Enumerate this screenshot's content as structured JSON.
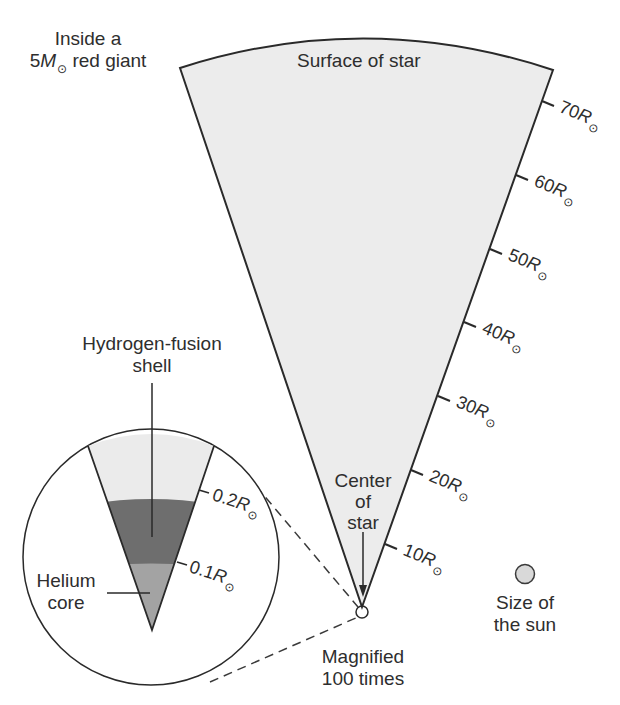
{
  "title": {
    "line1": "Inside a",
    "line2_prefix": "5",
    "line2_symbol": "M",
    "line2_sun": "⊙",
    "line2_suffix": " red giant"
  },
  "main_wedge": {
    "surface_label": "Surface of star",
    "center_label": [
      "Center",
      "of",
      "star"
    ],
    "fill_color": "#ececec",
    "scale_ticks": [
      {
        "value": "70",
        "unit": "R",
        "sun": "⊙"
      },
      {
        "value": "60",
        "unit": "R",
        "sun": "⊙"
      },
      {
        "value": "50",
        "unit": "R",
        "sun": "⊙"
      },
      {
        "value": "40",
        "unit": "R",
        "sun": "⊙"
      },
      {
        "value": "30",
        "unit": "R",
        "sun": "⊙"
      },
      {
        "value": "20",
        "unit": "R",
        "sun": "⊙"
      },
      {
        "value": "10",
        "unit": "R",
        "sun": "⊙"
      }
    ]
  },
  "magnified_inset": {
    "caption": [
      "Magnified",
      "100 times"
    ],
    "hydrogen_shell_label": [
      "Hydrogen-fusion",
      "shell"
    ],
    "helium_core_label": [
      "Helium",
      "core"
    ],
    "scale_ticks": [
      {
        "value": "0.2",
        "unit": "R",
        "sun": "⊙"
      },
      {
        "value": "0.1",
        "unit": "R",
        "sun": "⊙"
      }
    ],
    "colors": {
      "envelope": "#ebebeb",
      "hydrogen_shell": "#6e6e6e",
      "helium_core": "#a3a3a3"
    }
  },
  "sun_reference": {
    "label": [
      "Size of",
      "the sun"
    ],
    "fill_color": "#d9d9d9"
  }
}
